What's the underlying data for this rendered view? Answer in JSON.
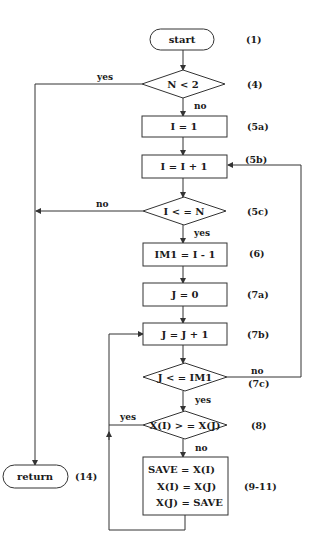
{
  "diagram": {
    "type": "flowchart",
    "nodes": [
      {
        "id": "start",
        "shape": "terminal",
        "text": "start",
        "label": "(1)"
      },
      {
        "id": "n_lt_2",
        "shape": "decision",
        "text": "N < 2",
        "label": "(4)"
      },
      {
        "id": "i_eq_1",
        "shape": "process",
        "text": "I = 1",
        "label": "(5a)"
      },
      {
        "id": "i_inc",
        "shape": "process",
        "text": "I = I + 1",
        "label": "(5b)"
      },
      {
        "id": "i_le_n",
        "shape": "decision",
        "text": "I < = N",
        "label": "(5c)"
      },
      {
        "id": "im1",
        "shape": "process",
        "text": "IM1 = I - 1",
        "label": "(6)"
      },
      {
        "id": "j_eq_0",
        "shape": "process",
        "text": "J = 0",
        "label": "(7a)"
      },
      {
        "id": "j_inc",
        "shape": "process",
        "text": "J = J + 1",
        "label": "(7b)"
      },
      {
        "id": "j_le_im1",
        "shape": "decision",
        "text": "J < = IM1",
        "label": "(7c)"
      },
      {
        "id": "cmp",
        "shape": "decision",
        "text": "X(I) > = X(J)",
        "label": "(8)"
      },
      {
        "id": "swap",
        "shape": "process",
        "lines": [
          "SAVE = X(I)",
          "X(I) = X(J)",
          "X(J) = SAVE"
        ],
        "label": "(9-11)"
      },
      {
        "id": "return",
        "shape": "terminal",
        "text": "return",
        "label": "(14)"
      }
    ],
    "edge_labels": {
      "n_lt_2_yes": "yes",
      "n_lt_2_no": "no",
      "i_le_n_no": "no",
      "i_le_n_yes": "yes",
      "j_le_im1_no": "no",
      "j_le_im1_yes": "yes",
      "cmp_yes": "yes",
      "cmp_no": "no"
    },
    "edges": [
      {
        "from": "start",
        "to": "n_lt_2"
      },
      {
        "from": "n_lt_2",
        "to": "return",
        "label": "yes"
      },
      {
        "from": "n_lt_2",
        "to": "i_eq_1",
        "label": "no"
      },
      {
        "from": "i_eq_1",
        "to": "i_inc"
      },
      {
        "from": "i_inc",
        "to": "i_le_n"
      },
      {
        "from": "i_le_n",
        "to": "return",
        "label": "no"
      },
      {
        "from": "i_le_n",
        "to": "im1",
        "label": "yes"
      },
      {
        "from": "im1",
        "to": "j_eq_0"
      },
      {
        "from": "j_eq_0",
        "to": "j_inc"
      },
      {
        "from": "j_inc",
        "to": "j_le_im1"
      },
      {
        "from": "j_le_im1",
        "to": "i_inc",
        "label": "no"
      },
      {
        "from": "j_le_im1",
        "to": "cmp",
        "label": "yes"
      },
      {
        "from": "cmp",
        "to": "j_inc",
        "label": "yes"
      },
      {
        "from": "cmp",
        "to": "swap",
        "label": "no"
      },
      {
        "from": "swap",
        "to": "j_inc"
      }
    ]
  }
}
